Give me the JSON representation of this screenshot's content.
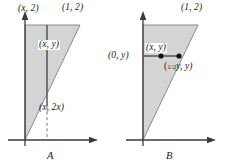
{
  "figure": {
    "type": "geometry-diagram",
    "colors": {
      "shading": "#d4d4d4",
      "outline": "#8a8a8a",
      "axis": "#3a3a3a",
      "segment": "#555555",
      "point": "#111111",
      "background": "#ffffff",
      "text": "#1a1a1a"
    },
    "panels": [
      {
        "id": "A",
        "letter": "A",
        "region": {
          "vertices": [
            [
              0,
              0
            ],
            [
              0,
              2
            ],
            [
              1,
              2
            ]
          ],
          "shaded": true,
          "hypotenuse": "y = 2x"
        },
        "axes": {
          "x_axis": true,
          "y_axis": true,
          "arrows": true,
          "origin": [
            0,
            0
          ]
        },
        "labels": {
          "top_left": "(x, 2)",
          "top_right": "(1, 2)",
          "interior_point": "(x, y)",
          "bottom": "(x, 2x)"
        },
        "markers": {
          "vertical_segment": {
            "from": "(x, 2x)",
            "to": "(x, 2)",
            "style": "solid"
          },
          "dashed_drop": {
            "from": "(x, 2x)",
            "to": "(x, 0)",
            "style": "dashed"
          },
          "dot_at": "(x, y)"
        }
      },
      {
        "id": "B",
        "letter": "B",
        "region": {
          "vertices": [
            [
              0,
              0
            ],
            [
              0,
              2
            ],
            [
              1,
              2
            ]
          ],
          "shaded": true,
          "hypotenuse": "x = y/2"
        },
        "axes": {
          "x_axis": true,
          "y_axis": true,
          "arrows": true,
          "origin": [
            0,
            0
          ]
        },
        "labels": {
          "top_right": "(1, 2)",
          "left": "(0, y)",
          "interior_point": "(x, y)",
          "right_numerator": "1",
          "right_denominator": "2",
          "right_tail": "y, y)"
        },
        "markers": {
          "horizontal_segment": {
            "from": "(0, y)",
            "to": "(1/2 y, y)",
            "style": "solid"
          },
          "dot_left": "(0, y)",
          "dot_middle": "(x, y)",
          "dot_right": "(1/2 y, y)"
        }
      }
    ]
  }
}
